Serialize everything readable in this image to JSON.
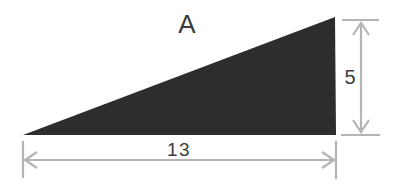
{
  "figure": {
    "label": "A",
    "shape": "right-triangle",
    "base_label": "13",
    "height_label": "5",
    "colors": {
      "triangle_fill": "#2e2d2c",
      "dimension_line": "#b5b4b2",
      "text": "#3c3c3c",
      "background": "#ffffff"
    }
  }
}
